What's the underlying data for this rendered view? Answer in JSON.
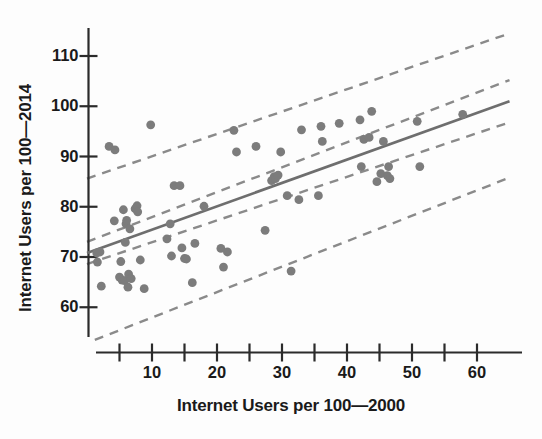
{
  "chart_data": {
    "type": "scatter",
    "title": "",
    "xlabel": "Internet Users per 100—2000",
    "ylabel": "Internet Users per 100—2014",
    "xlim": [
      -1.5,
      68
    ],
    "ylim": [
      53,
      114
    ],
    "grid": false,
    "legend": null,
    "xticks": [
      5,
      10,
      15,
      20,
      25,
      30,
      35,
      40,
      45,
      50,
      55,
      60
    ],
    "xtick_labels": [
      "",
      "10",
      "",
      "20",
      "",
      "30",
      "",
      "40",
      "",
      "50",
      "",
      "60"
    ],
    "yticks": [
      60,
      70,
      80,
      90,
      100,
      110
    ],
    "ytick_labels": [
      "60",
      "70",
      "80",
      "90",
      "100",
      "110"
    ],
    "marker_color": "#7c7c7c",
    "line_color": "#6e6e6e",
    "band_color": "#8a8a8a",
    "points": [
      [
        1.5,
        70.8
      ],
      [
        1.6,
        69.0
      ],
      [
        2.0,
        71.0
      ],
      [
        2.2,
        64.2
      ],
      [
        3.4,
        92.0
      ],
      [
        4.2,
        77.2
      ],
      [
        4.3,
        91.3
      ],
      [
        5.0,
        66.0
      ],
      [
        5.2,
        69.1
      ],
      [
        5.4,
        65.4
      ],
      [
        5.6,
        79.4
      ],
      [
        5.8,
        65.3
      ],
      [
        5.9,
        72.9
      ],
      [
        6.0,
        76.6
      ],
      [
        6.1,
        77.3
      ],
      [
        6.3,
        64.0
      ],
      [
        6.4,
        66.6
      ],
      [
        6.6,
        75.6
      ],
      [
        6.8,
        65.7
      ],
      [
        7.4,
        79.6
      ],
      [
        7.7,
        80.2
      ],
      [
        7.8,
        79.0
      ],
      [
        8.2,
        69.4
      ],
      [
        8.8,
        63.7
      ],
      [
        9.8,
        96.3
      ],
      [
        12.3,
        73.6
      ],
      [
        12.8,
        76.6
      ],
      [
        13.0,
        70.2
      ],
      [
        13.4,
        84.2
      ],
      [
        14.3,
        84.2
      ],
      [
        14.6,
        71.8
      ],
      [
        15.0,
        69.7
      ],
      [
        15.3,
        69.6
      ],
      [
        16.2,
        64.9
      ],
      [
        16.6,
        72.7
      ],
      [
        18.0,
        80.1
      ],
      [
        20.6,
        71.7
      ],
      [
        21.0,
        68.0
      ],
      [
        21.6,
        71.0
      ],
      [
        22.6,
        95.2
      ],
      [
        23.0,
        90.9
      ],
      [
        26.0,
        92.0
      ],
      [
        27.4,
        75.3
      ],
      [
        28.4,
        85.2
      ],
      [
        28.8,
        86.0
      ],
      [
        29.0,
        85.6
      ],
      [
        29.4,
        86.3
      ],
      [
        29.8,
        90.9
      ],
      [
        30.8,
        82.2
      ],
      [
        31.4,
        67.2
      ],
      [
        32.6,
        81.4
      ],
      [
        33.0,
        95.3
      ],
      [
        35.6,
        82.2
      ],
      [
        36.0,
        96.0
      ],
      [
        36.2,
        93.0
      ],
      [
        38.8,
        96.6
      ],
      [
        42.0,
        97.3
      ],
      [
        42.2,
        88.0
      ],
      [
        42.6,
        93.4
      ],
      [
        43.4,
        93.8
      ],
      [
        43.8,
        99.0
      ],
      [
        44.6,
        85.0
      ],
      [
        45.2,
        86.6
      ],
      [
        45.6,
        93.0
      ],
      [
        46.2,
        86.2
      ],
      [
        46.4,
        88.0
      ],
      [
        46.6,
        85.6
      ],
      [
        50.8,
        97.0
      ],
      [
        51.2,
        88.0
      ],
      [
        57.8,
        98.4
      ]
    ],
    "regression_line": {
      "x0": 0,
      "y0": 70.8,
      "x1": 65,
      "y1": 101.0
    },
    "bands": [
      {
        "name": "outer-upper",
        "x0": 0,
        "y0": 85.6,
        "x1": 65,
        "y1": 114.5
      },
      {
        "name": "inner-upper",
        "x0": 0,
        "y0": 73.0,
        "x1": 65,
        "y1": 105.2
      },
      {
        "name": "inner-lower",
        "x0": 0,
        "y0": 68.6,
        "x1": 65,
        "y1": 96.8
      },
      {
        "name": "outer-lower",
        "x0": 1.2,
        "y0": 53.5,
        "x1": 65,
        "y1": 85.8
      }
    ]
  }
}
